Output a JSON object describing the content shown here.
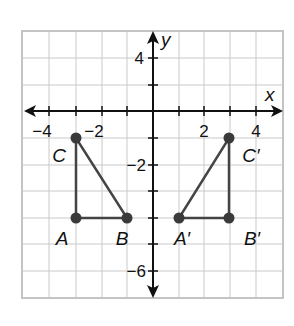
{
  "diagram": {
    "type": "coordinate-plane",
    "axes": {
      "x_label": "x",
      "y_label": "y",
      "x_tick_labels": [
        {
          "value": -4,
          "text": "−4"
        },
        {
          "value": -2,
          "text": "−2"
        },
        {
          "value": 2,
          "text": "2"
        },
        {
          "value": 4,
          "text": "4"
        }
      ],
      "y_tick_labels": [
        {
          "position": "upper",
          "text": "4"
        },
        {
          "position": "lower",
          "text": "−2"
        },
        {
          "position": "bottom",
          "text": "−6"
        }
      ]
    },
    "figures": [
      {
        "name": "triangle-ABC",
        "vertices": [
          {
            "label": "A",
            "x": -3,
            "y": -4
          },
          {
            "label": "B",
            "x": -1,
            "y": -4
          },
          {
            "label": "C",
            "x": -3,
            "y": -1
          }
        ]
      },
      {
        "name": "triangle-A'B'C'",
        "vertices": [
          {
            "label": "A′",
            "x": 1,
            "y": -4
          },
          {
            "label": "B′",
            "x": 3,
            "y": -4
          },
          {
            "label": "C′",
            "x": 3,
            "y": -1
          }
        ]
      }
    ],
    "colors": {
      "grid": "#c9c9c9",
      "axis": "#111111",
      "figure": "#444444",
      "vertex": "#3a3a3a"
    }
  }
}
